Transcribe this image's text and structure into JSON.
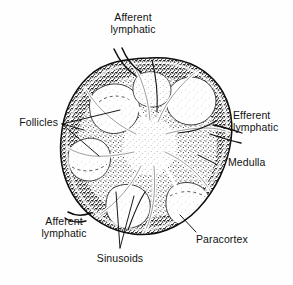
{
  "figure": {
    "background_color": "#fefefe",
    "ink_color": "#111111",
    "width": 293,
    "height": 285
  },
  "labels": {
    "afferent_top": "Afferent\nlymphatic",
    "follicles": "Follicles",
    "efferent": "Efferent\nlymphatic",
    "medulla": "Medulla",
    "afferent_bottom": "Afferent\nlymphatic",
    "sinusoids": "Sinusoids",
    "paracortex": "Paracortex"
  },
  "structures": [
    {
      "name": "capsule",
      "description": "outer boundary of lymph node"
    },
    {
      "name": "cortex",
      "description": "dark stippled outer zone"
    },
    {
      "name": "follicles",
      "description": "pale rounded germinal centers in cortex",
      "count": 6
    },
    {
      "name": "paracortex",
      "description": "stippled zone deep to cortex"
    },
    {
      "name": "medulla",
      "description": "central stippled zone"
    },
    {
      "name": "sinusoids",
      "description": "pale channels radiating from hilum"
    },
    {
      "name": "afferent-lymphatic-vessels",
      "count": 2
    },
    {
      "name": "efferent-lymphatic-vessel",
      "count": 1
    }
  ]
}
